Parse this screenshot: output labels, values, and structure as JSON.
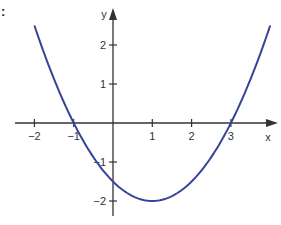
{
  "corner_label": ":",
  "colors": {
    "curve": "#34449a",
    "axis": "#333333",
    "text": "#333333"
  },
  "chart_data": {
    "type": "line",
    "title": "",
    "xlabel": "x",
    "ylabel": "y",
    "function": "y = 0.5(x - 1)^2 - 2",
    "xlim": [
      -2.5,
      4.1
    ],
    "ylim": [
      -2.4,
      2.9
    ],
    "grid": false,
    "legend": null,
    "x_ticks": [
      -2,
      -1,
      1,
      2,
      3
    ],
    "x_tick_labels": [
      "−2",
      "−1",
      "1",
      "2",
      "3"
    ],
    "y_ticks": [
      -2,
      -1,
      1,
      2
    ],
    "y_tick_labels": [
      "−2",
      "−1",
      "1",
      "2"
    ],
    "series": [
      {
        "name": "parabola",
        "x": [
          -2,
          -1.5,
          -1,
          -0.5,
          0,
          0.5,
          1,
          1.5,
          2,
          2.5,
          3,
          3.5,
          4
        ],
        "y": [
          2.5,
          1.125,
          0,
          -0.875,
          -1.5,
          -1.875,
          -2,
          -1.875,
          -1.5,
          -0.875,
          0,
          1.125,
          2.5
        ]
      }
    ],
    "annotations": {
      "roots": [
        -1,
        3
      ],
      "vertex": [
        1,
        -2
      ],
      "y_intercept": -1.5
    }
  }
}
